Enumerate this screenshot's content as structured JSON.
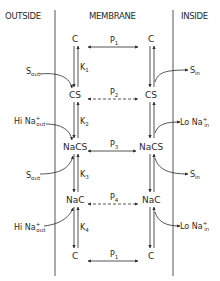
{
  "headers": {
    "outside": "OUTSIDE",
    "membrane": "MEMBRANE",
    "inside": "INSIDE"
  },
  "states": {
    "left": [
      "C",
      "CS",
      "NaCS",
      "NaC",
      "C"
    ],
    "right": [
      "C",
      "CS",
      "NaCS",
      "NaC",
      "C"
    ]
  },
  "rate_constants": {
    "k1": {
      "base": "K",
      "sub": "1"
    },
    "k2": {
      "base": "K",
      "sub": "2"
    },
    "k3": {
      "base": "K",
      "sub": "3"
    },
    "k4": {
      "base": "K",
      "sub": "4"
    }
  },
  "permeabilities": [
    {
      "base": "P",
      "sub": "1",
      "style": "solid"
    },
    {
      "base": "P",
      "sub": "2",
      "style": "dashed"
    },
    {
      "base": "P",
      "sub": "3",
      "style": "solid"
    },
    {
      "base": "P",
      "sub": "4",
      "style": "dashed"
    },
    {
      "base": "P",
      "sub": "1",
      "style": "solid"
    }
  ],
  "outside_species": [
    {
      "base": "S",
      "sub": "out",
      "sup": ""
    },
    {
      "base": "Hi Na",
      "sub": "out",
      "sup": "+"
    },
    {
      "base": "S",
      "sub": "out",
      "sup": ""
    },
    {
      "base": "Hi Na",
      "sub": "out",
      "sup": "+"
    }
  ],
  "inside_species": [
    {
      "base": "S",
      "sub": "in",
      "sup": ""
    },
    {
      "base": "Lo Na",
      "sub": "in",
      "sup": "+"
    },
    {
      "base": "S",
      "sub": "in",
      "sup": ""
    },
    {
      "base": "Lo Na",
      "sub": "in",
      "sup": "+"
    }
  ],
  "colors": {
    "ink": "#2a2a2a",
    "background": "#ffffff"
  }
}
